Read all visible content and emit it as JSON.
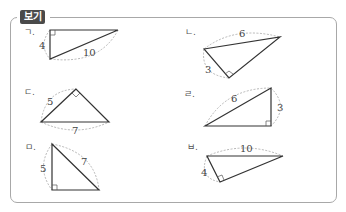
{
  "header": {
    "badge_label": "보기",
    "badge_color": "#4a4a4a"
  },
  "items": [
    {
      "label": "ㄱ.",
      "sides": [
        "4",
        "10"
      ],
      "right_angle": "top-left"
    },
    {
      "label": "ㄴ.",
      "sides": [
        "6",
        "3"
      ],
      "right_angle": "bottom"
    },
    {
      "label": "ㄷ.",
      "sides": [
        "5",
        "7"
      ],
      "right_angle": "apex"
    },
    {
      "label": "ㄹ.",
      "sides": [
        "6",
        "3"
      ],
      "right_angle": "bottom-right"
    },
    {
      "label": "ㅁ.",
      "sides": [
        "5",
        "7"
      ],
      "right_angle": "bottom-left"
    },
    {
      "label": "ㅂ.",
      "sides": [
        "10",
        "4"
      ],
      "right_angle": "bottom"
    }
  ]
}
